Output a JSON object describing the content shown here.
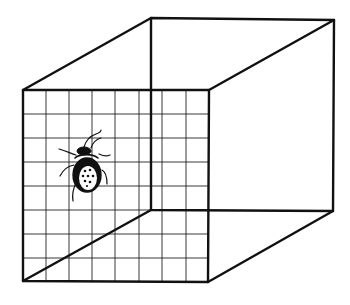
{
  "figure": {
    "stroke_color": "#111111",
    "background_color": "#ffffff"
  },
  "cube": {
    "front_face": {
      "tl": [
        23,
        90
      ],
      "tr": [
        209,
        90
      ],
      "br": [
        208,
        282
      ],
      "bl": [
        23,
        281
      ]
    },
    "back_face": {
      "tl": [
        151,
        18
      ],
      "tr": [
        334,
        20
      ],
      "br": [
        333,
        211
      ],
      "bl": [
        151,
        210
      ]
    },
    "grid": {
      "columns": 8,
      "rows": 8
    }
  },
  "bug": {
    "label": "bug",
    "center": [
      87,
      172
    ]
  }
}
